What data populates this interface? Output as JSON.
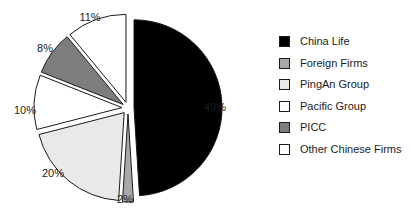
{
  "chart_data": {
    "type": "pie",
    "title": "",
    "categories": [
      "China Life",
      "Foreign Firms",
      "PingAn Group",
      "Pacific Group",
      "PICC",
      "Other Chinese Firms"
    ],
    "values": [
      49,
      2,
      20,
      10,
      8,
      11
    ],
    "value_labels": [
      "49%",
      "2%",
      "20%",
      "10%",
      "8%",
      "11%"
    ],
    "colors": [
      "#000000",
      "#a8a8a8",
      "#e9e9e9",
      "#ffffff",
      "#7d7d7d",
      "#ffffff"
    ],
    "slice_border_color": "#1a1a1a",
    "exploded": true,
    "start_angle_deg": 0,
    "direction": "clockwise",
    "legend_position": "right",
    "grid": false
  },
  "legend": {
    "items": [
      {
        "label": "China Life",
        "color": "#000000"
      },
      {
        "label": "Foreign Firms",
        "color": "#a8a8a8"
      },
      {
        "label": "PingAn Group",
        "color": "#e9e9e9"
      },
      {
        "label": "Pacific Group",
        "color": "#ffffff"
      },
      {
        "label": "PICC",
        "color": "#7d7d7d"
      },
      {
        "label": "Other Chinese Firms",
        "color": "#ffffff"
      }
    ]
  },
  "labels": {
    "china_life": "49%",
    "foreign_firms": "2%",
    "pingan_group": "20%",
    "pacific_group": "10%",
    "picc": "8%",
    "other_chinese_firms": "11%"
  }
}
